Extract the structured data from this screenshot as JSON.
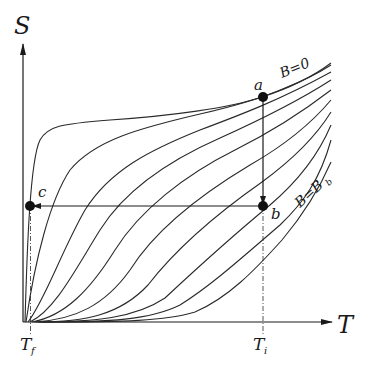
{
  "figure": {
    "type": "S-T diagram (entropy vs temperature) for adiabatic demagnetization",
    "axes": {
      "y_label": "S",
      "x_label": "T"
    },
    "ticks": {
      "t_final": "T",
      "t_final_sub": "f",
      "t_initial": "T",
      "t_initial_sub": "i"
    },
    "points": {
      "a": "a",
      "b": "b",
      "c": "c"
    },
    "curve_labels": {
      "top": "B=0",
      "bottom_main": "B=B",
      "bottom_sub": "b"
    },
    "process": [
      {
        "from": "a",
        "to": "b",
        "description": "isothermal magnetization at T_i"
      },
      {
        "from": "b",
        "to": "c",
        "description": "adiabatic demagnetization to T_f"
      }
    ],
    "curve_count": 10,
    "colors": {
      "line": "#2a2a2a",
      "background": "#ffffff"
    }
  }
}
